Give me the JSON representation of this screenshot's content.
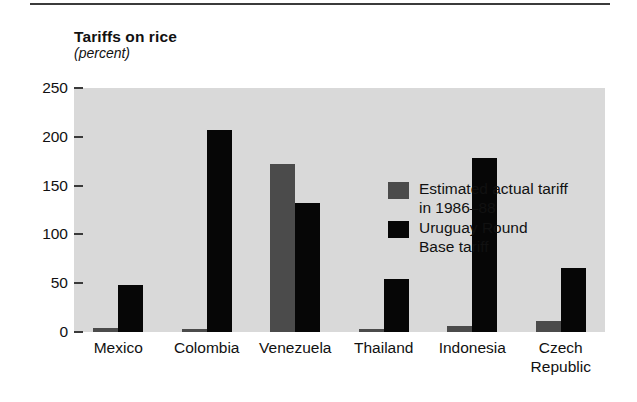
{
  "chart_data": {
    "type": "bar",
    "title": "Tariffs on rice",
    "subtitle": "(percent)",
    "xlabel": "",
    "ylabel": "",
    "ylim": [
      0,
      250
    ],
    "yticks": [
      0,
      50,
      100,
      150,
      200,
      250
    ],
    "ytick_labels": [
      "0",
      "50",
      "100",
      "150",
      "200",
      "250"
    ],
    "grid": false,
    "legend_position": "inside-top-right",
    "categories": [
      "Mexico",
      "Colombia",
      "Venezuela",
      "Thailand",
      "Indonesia",
      "Czech\nRepublic"
    ],
    "series": [
      {
        "name": "Estimated actual tariff\nin 1986–88",
        "color": "#4b4b4b",
        "values": [
          4,
          2,
          172,
          1,
          6,
          11
        ]
      },
      {
        "name": "Uruguay Round\nBase tariff",
        "color": "#060606",
        "values": [
          48,
          207,
          132,
          54,
          178,
          66
        ]
      }
    ]
  },
  "legend": {
    "items": [
      {
        "label": "Estimated actual tariff\nin 1986–88",
        "swatch": "actual"
      },
      {
        "label": "Uruguay Round\nBase tariff",
        "swatch": "uruguay"
      }
    ]
  },
  "colors": {
    "plot_background": "#d9d9d9",
    "page_background": "#ffffff",
    "actual_tariff": "#4b4b4b",
    "uruguay_tariff": "#060606",
    "axis": "#3a3a3a",
    "text": "#111111"
  }
}
